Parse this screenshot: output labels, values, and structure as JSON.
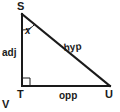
{
  "figure": {
    "type": "right-triangle-trigonometry-diagram",
    "background_color": "#ffffff",
    "line_color": "#1a1a1a",
    "vertices": {
      "top": {
        "label": "S",
        "x": 22,
        "y": 13
      },
      "bottom_left": {
        "label": "T",
        "x": 22,
        "y": 86
      },
      "bottom_right": {
        "label": "U",
        "x": 110,
        "y": 86
      }
    },
    "sides": {
      "vertical": {
        "label": "adj",
        "from": "S",
        "to": "T"
      },
      "horizontal": {
        "label": "opp",
        "from": "T",
        "to": "U"
      },
      "hypotenuse": {
        "label": "hyp",
        "from": "S",
        "to": "U"
      }
    },
    "angles": {
      "marked_angle": {
        "label": "x",
        "at_vertex": "S",
        "style": "arc"
      },
      "right_angle": {
        "label": "",
        "at_vertex": "T",
        "style": "square"
      }
    },
    "extra_labels": {
      "corner_mark": "V"
    }
  }
}
